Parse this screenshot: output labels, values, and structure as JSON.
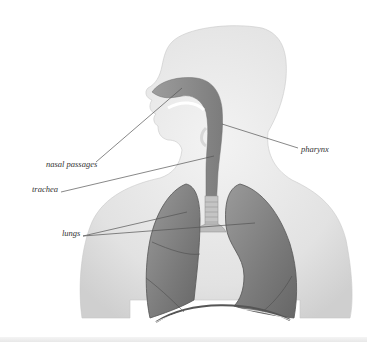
{
  "diagram": {
    "type": "anatomical-illustration",
    "colors": {
      "background": "#ffffff",
      "body_silhouette": "#e6e6e6",
      "airway": "#8a8a8a",
      "lungs": "#7d7d7d",
      "label_line": "#555555",
      "label_text": "#333333"
    },
    "labels": [
      {
        "id": "nasal-passages",
        "text": "nasal passages"
      },
      {
        "id": "pharynx",
        "text": "pharynx"
      },
      {
        "id": "trachea",
        "text": "trachea"
      },
      {
        "id": "lungs",
        "text": "lungs"
      }
    ]
  }
}
